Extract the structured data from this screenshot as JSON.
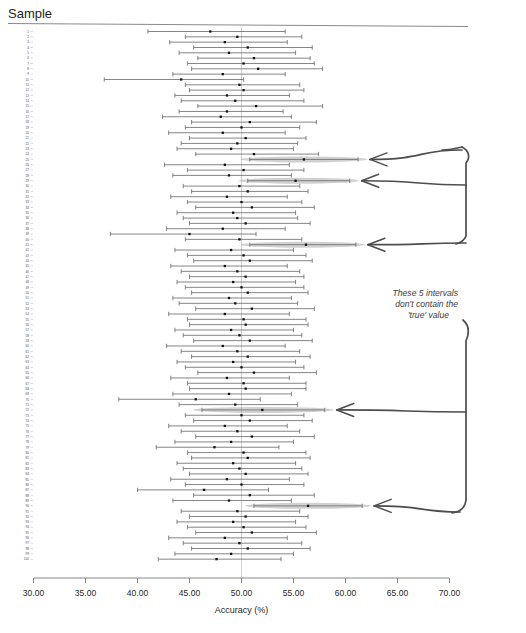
{
  "header": {
    "title": "Sample"
  },
  "annotation": {
    "line1": "These 5 intervals",
    "line2": "don't contain the",
    "line3": "'true' value"
  },
  "colors": {
    "interval_line": "#6f6f6f",
    "point": "#111111",
    "highlight_fill": "#9a9a9a",
    "arrow": "#4d4d4d",
    "reference_line": "#b9b9b9",
    "axis": "#6a6a6a",
    "text": "#231f20"
  },
  "chart_data": {
    "type": "scatter",
    "title": "Sample",
    "xlabel": "Accuracy (%)",
    "ylabel": "Sample",
    "xlim": [
      30.0,
      70.0
    ],
    "xticks": [
      30.0,
      35.0,
      40.0,
      45.0,
      50.0,
      55.0,
      60.0,
      65.0,
      70.0
    ],
    "xticklabels": [
      "30.00",
      "35.00",
      "40.00",
      "45.00",
      "50.00",
      "55.00",
      "60.00",
      "65.00",
      "70.00"
    ],
    "grid": false,
    "legend": "none",
    "reference_line_x": 50.0,
    "reference_line_label": "true value = 50",
    "ylim": [
      1,
      100
    ],
    "ytick_start": 1,
    "ytick_end": 100,
    "ytick_step": 1,
    "series_name": "95% confidence interval for accuracy",
    "n_samples": 100,
    "n_missing_true_value": 5,
    "missing_sample_ids": [
      25,
      29,
      41,
      72,
      90
    ],
    "points": [
      {
        "sample": 1,
        "lower": 41.0,
        "mean": 47.0,
        "upper": 54.2,
        "contains_true": true
      },
      {
        "sample": 2,
        "lower": 44.6,
        "mean": 49.6,
        "upper": 55.8,
        "contains_true": true
      },
      {
        "sample": 3,
        "lower": 43.1,
        "mean": 48.4,
        "upper": 54.4,
        "contains_true": true
      },
      {
        "sample": 4,
        "lower": 45.4,
        "mean": 50.6,
        "upper": 56.8,
        "contains_true": true
      },
      {
        "sample": 5,
        "lower": 44.0,
        "mean": 48.8,
        "upper": 55.2,
        "contains_true": true
      },
      {
        "sample": 6,
        "lower": 45.8,
        "mean": 51.2,
        "upper": 56.6,
        "contains_true": true
      },
      {
        "sample": 7,
        "lower": 44.8,
        "mean": 50.2,
        "upper": 57.0,
        "contains_true": true
      },
      {
        "sample": 8,
        "lower": 45.2,
        "mean": 51.6,
        "upper": 57.8,
        "contains_true": true
      },
      {
        "sample": 9,
        "lower": 43.4,
        "mean": 48.2,
        "upper": 54.2,
        "contains_true": true
      },
      {
        "sample": 10,
        "lower": 36.8,
        "mean": 44.2,
        "upper": 50.2,
        "contains_true": true
      },
      {
        "sample": 11,
        "lower": 44.6,
        "mean": 49.8,
        "upper": 55.6,
        "contains_true": true
      },
      {
        "sample": 12,
        "lower": 45.0,
        "mean": 50.2,
        "upper": 56.0,
        "contains_true": true
      },
      {
        "sample": 13,
        "lower": 43.6,
        "mean": 48.6,
        "upper": 54.6,
        "contains_true": true
      },
      {
        "sample": 14,
        "lower": 44.2,
        "mean": 49.4,
        "upper": 56.0,
        "contains_true": true
      },
      {
        "sample": 15,
        "lower": 45.8,
        "mean": 51.4,
        "upper": 57.8,
        "contains_true": true
      },
      {
        "sample": 16,
        "lower": 44.0,
        "mean": 48.6,
        "upper": 54.0,
        "contains_true": true
      },
      {
        "sample": 17,
        "lower": 42.4,
        "mean": 48.0,
        "upper": 54.8,
        "contains_true": true
      },
      {
        "sample": 18,
        "lower": 45.2,
        "mean": 50.8,
        "upper": 57.2,
        "contains_true": true
      },
      {
        "sample": 19,
        "lower": 44.6,
        "mean": 50.0,
        "upper": 55.6,
        "contains_true": true
      },
      {
        "sample": 20,
        "lower": 43.0,
        "mean": 48.2,
        "upper": 54.2,
        "contains_true": true
      },
      {
        "sample": 21,
        "lower": 45.0,
        "mean": 50.4,
        "upper": 56.2,
        "contains_true": true
      },
      {
        "sample": 22,
        "lower": 44.2,
        "mean": 49.6,
        "upper": 55.4,
        "contains_true": true
      },
      {
        "sample": 23,
        "lower": 43.8,
        "mean": 49.0,
        "upper": 55.0,
        "contains_true": true
      },
      {
        "sample": 24,
        "lower": 45.6,
        "mean": 51.2,
        "upper": 57.4,
        "contains_true": true
      },
      {
        "sample": 25,
        "lower": 50.8,
        "mean": 56.0,
        "upper": 61.2,
        "contains_true": false
      },
      {
        "sample": 26,
        "lower": 42.6,
        "mean": 48.4,
        "upper": 54.6,
        "contains_true": true
      },
      {
        "sample": 27,
        "lower": 44.8,
        "mean": 50.2,
        "upper": 56.0,
        "contains_true": true
      },
      {
        "sample": 28,
        "lower": 43.4,
        "mean": 48.8,
        "upper": 54.8,
        "contains_true": true
      },
      {
        "sample": 29,
        "lower": 50.6,
        "mean": 55.2,
        "upper": 60.4,
        "contains_true": false
      },
      {
        "sample": 30,
        "lower": 44.4,
        "mean": 49.8,
        "upper": 55.6,
        "contains_true": true
      },
      {
        "sample": 31,
        "lower": 45.2,
        "mean": 50.6,
        "upper": 56.4,
        "contains_true": true
      },
      {
        "sample": 32,
        "lower": 43.2,
        "mean": 48.6,
        "upper": 54.4,
        "contains_true": true
      },
      {
        "sample": 33,
        "lower": 44.8,
        "mean": 50.0,
        "upper": 55.8,
        "contains_true": true
      },
      {
        "sample": 34,
        "lower": 45.6,
        "mean": 51.0,
        "upper": 57.0,
        "contains_true": true
      },
      {
        "sample": 35,
        "lower": 43.8,
        "mean": 49.2,
        "upper": 55.2,
        "contains_true": true
      },
      {
        "sample": 36,
        "lower": 44.4,
        "mean": 49.6,
        "upper": 55.4,
        "contains_true": true
      },
      {
        "sample": 37,
        "lower": 45.0,
        "mean": 50.4,
        "upper": 56.6,
        "contains_true": true
      },
      {
        "sample": 38,
        "lower": 42.8,
        "mean": 48.2,
        "upper": 54.2,
        "contains_true": true
      },
      {
        "sample": 39,
        "lower": 37.4,
        "mean": 45.0,
        "upper": 51.4,
        "contains_true": true
      },
      {
        "sample": 40,
        "lower": 44.6,
        "mean": 49.8,
        "upper": 55.8,
        "contains_true": true
      },
      {
        "sample": 41,
        "lower": 50.8,
        "mean": 56.2,
        "upper": 61.0,
        "contains_true": false
      },
      {
        "sample": 42,
        "lower": 43.6,
        "mean": 49.0,
        "upper": 55.0,
        "contains_true": true
      },
      {
        "sample": 43,
        "lower": 44.8,
        "mean": 50.2,
        "upper": 56.2,
        "contains_true": true
      },
      {
        "sample": 44,
        "lower": 45.4,
        "mean": 50.8,
        "upper": 56.8,
        "contains_true": true
      },
      {
        "sample": 45,
        "lower": 43.2,
        "mean": 48.4,
        "upper": 54.4,
        "contains_true": true
      },
      {
        "sample": 46,
        "lower": 44.2,
        "mean": 49.6,
        "upper": 55.6,
        "contains_true": true
      },
      {
        "sample": 47,
        "lower": 45.0,
        "mean": 50.4,
        "upper": 56.0,
        "contains_true": true
      },
      {
        "sample": 48,
        "lower": 43.8,
        "mean": 49.2,
        "upper": 55.2,
        "contains_true": true
      },
      {
        "sample": 49,
        "lower": 44.6,
        "mean": 50.0,
        "upper": 56.0,
        "contains_true": true
      },
      {
        "sample": 50,
        "lower": 45.2,
        "mean": 50.6,
        "upper": 56.4,
        "contains_true": true
      },
      {
        "sample": 51,
        "lower": 43.4,
        "mean": 48.8,
        "upper": 54.8,
        "contains_true": true
      },
      {
        "sample": 52,
        "lower": 44.0,
        "mean": 49.4,
        "upper": 55.4,
        "contains_true": true
      },
      {
        "sample": 53,
        "lower": 45.6,
        "mean": 51.0,
        "upper": 57.0,
        "contains_true": true
      },
      {
        "sample": 54,
        "lower": 43.0,
        "mean": 48.4,
        "upper": 54.6,
        "contains_true": true
      },
      {
        "sample": 55,
        "lower": 44.8,
        "mean": 50.2,
        "upper": 56.2,
        "contains_true": true
      },
      {
        "sample": 56,
        "lower": 45.0,
        "mean": 50.4,
        "upper": 56.4,
        "contains_true": true
      },
      {
        "sample": 57,
        "lower": 43.6,
        "mean": 49.0,
        "upper": 55.0,
        "contains_true": true
      },
      {
        "sample": 58,
        "lower": 44.4,
        "mean": 49.8,
        "upper": 55.8,
        "contains_true": true
      },
      {
        "sample": 59,
        "lower": 45.4,
        "mean": 50.8,
        "upper": 56.8,
        "contains_true": true
      },
      {
        "sample": 60,
        "lower": 42.8,
        "mean": 48.2,
        "upper": 54.2,
        "contains_true": true
      },
      {
        "sample": 61,
        "lower": 44.2,
        "mean": 49.6,
        "upper": 55.6,
        "contains_true": true
      },
      {
        "sample": 62,
        "lower": 45.2,
        "mean": 50.6,
        "upper": 56.6,
        "contains_true": true
      },
      {
        "sample": 63,
        "lower": 43.8,
        "mean": 49.2,
        "upper": 55.2,
        "contains_true": true
      },
      {
        "sample": 64,
        "lower": 44.6,
        "mean": 50.0,
        "upper": 56.0,
        "contains_true": true
      },
      {
        "sample": 65,
        "lower": 45.8,
        "mean": 51.2,
        "upper": 57.2,
        "contains_true": true
      },
      {
        "sample": 66,
        "lower": 43.2,
        "mean": 48.6,
        "upper": 54.6,
        "contains_true": true
      },
      {
        "sample": 67,
        "lower": 44.8,
        "mean": 50.2,
        "upper": 56.2,
        "contains_true": true
      },
      {
        "sample": 68,
        "lower": 45.0,
        "mean": 50.4,
        "upper": 56.2,
        "contains_true": true
      },
      {
        "sample": 69,
        "lower": 43.4,
        "mean": 48.8,
        "upper": 54.8,
        "contains_true": true
      },
      {
        "sample": 70,
        "lower": 38.2,
        "mean": 45.6,
        "upper": 51.8,
        "contains_true": true
      },
      {
        "sample": 71,
        "lower": 44.0,
        "mean": 49.4,
        "upper": 55.4,
        "contains_true": true
      },
      {
        "sample": 72,
        "lower": 46.2,
        "mean": 52.0,
        "upper": 58.0,
        "contains_true": false
      },
      {
        "sample": 73,
        "lower": 44.6,
        "mean": 50.0,
        "upper": 56.0,
        "contains_true": true
      },
      {
        "sample": 74,
        "lower": 45.4,
        "mean": 50.8,
        "upper": 56.8,
        "contains_true": true
      },
      {
        "sample": 75,
        "lower": 43.0,
        "mean": 48.4,
        "upper": 54.4,
        "contains_true": true
      },
      {
        "sample": 76,
        "lower": 44.2,
        "mean": 49.6,
        "upper": 55.6,
        "contains_true": true
      },
      {
        "sample": 77,
        "lower": 45.6,
        "mean": 51.0,
        "upper": 57.0,
        "contains_true": true
      },
      {
        "sample": 78,
        "lower": 43.6,
        "mean": 49.0,
        "upper": 55.0,
        "contains_true": true
      },
      {
        "sample": 79,
        "lower": 41.8,
        "mean": 47.4,
        "upper": 53.6,
        "contains_true": true
      },
      {
        "sample": 80,
        "lower": 44.8,
        "mean": 50.2,
        "upper": 56.2,
        "contains_true": true
      },
      {
        "sample": 81,
        "lower": 45.2,
        "mean": 50.6,
        "upper": 56.6,
        "contains_true": true
      },
      {
        "sample": 82,
        "lower": 43.8,
        "mean": 49.2,
        "upper": 55.2,
        "contains_true": true
      },
      {
        "sample": 83,
        "lower": 44.4,
        "mean": 49.8,
        "upper": 55.8,
        "contains_true": true
      },
      {
        "sample": 84,
        "lower": 45.0,
        "mean": 50.4,
        "upper": 56.4,
        "contains_true": true
      },
      {
        "sample": 85,
        "lower": 43.2,
        "mean": 48.6,
        "upper": 54.6,
        "contains_true": true
      },
      {
        "sample": 86,
        "lower": 44.6,
        "mean": 50.0,
        "upper": 56.0,
        "contains_true": true
      },
      {
        "sample": 87,
        "lower": 40.0,
        "mean": 46.4,
        "upper": 52.6,
        "contains_true": true
      },
      {
        "sample": 88,
        "lower": 45.4,
        "mean": 50.8,
        "upper": 57.0,
        "contains_true": true
      },
      {
        "sample": 89,
        "lower": 43.4,
        "mean": 48.8,
        "upper": 54.8,
        "contains_true": true
      },
      {
        "sample": 90,
        "lower": 51.2,
        "mean": 56.4,
        "upper": 61.6,
        "contains_true": false
      },
      {
        "sample": 91,
        "lower": 44.2,
        "mean": 49.6,
        "upper": 55.6,
        "contains_true": true
      },
      {
        "sample": 92,
        "lower": 45.0,
        "mean": 50.4,
        "upper": 56.4,
        "contains_true": true
      },
      {
        "sample": 93,
        "lower": 43.8,
        "mean": 49.2,
        "upper": 55.2,
        "contains_true": true
      },
      {
        "sample": 94,
        "lower": 44.8,
        "mean": 50.2,
        "upper": 56.2,
        "contains_true": true
      },
      {
        "sample": 95,
        "lower": 45.6,
        "mean": 51.0,
        "upper": 57.2,
        "contains_true": true
      },
      {
        "sample": 96,
        "lower": 43.0,
        "mean": 48.4,
        "upper": 54.4,
        "contains_true": true
      },
      {
        "sample": 97,
        "lower": 44.4,
        "mean": 49.8,
        "upper": 55.8,
        "contains_true": true
      },
      {
        "sample": 98,
        "lower": 45.2,
        "mean": 50.6,
        "upper": 56.6,
        "contains_true": true
      },
      {
        "sample": 99,
        "lower": 43.6,
        "mean": 49.0,
        "upper": 55.0,
        "contains_true": true
      },
      {
        "sample": 100,
        "lower": 42.0,
        "mean": 47.6,
        "upper": 53.8,
        "contains_true": true
      }
    ]
  }
}
